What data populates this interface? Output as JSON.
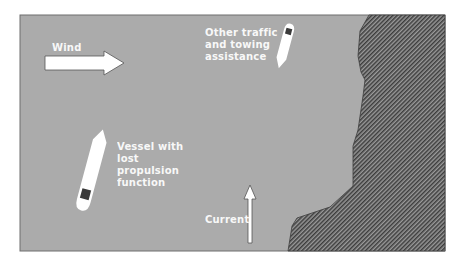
{
  "diagram": {
    "type": "maritime-scenario",
    "colors": {
      "background": "#ffffff",
      "sea": "#ababab",
      "frame_border": "#6e6e6e",
      "land_hatch_dark": "#3c3c3c",
      "land_hatch_light": "#9a9a9a",
      "vessel": "#ffffff",
      "vessel_mark": "#3a3a3a",
      "arrow_fill": "#ffffff",
      "arrow_stroke": "#555555",
      "label_text": "#ffffff"
    },
    "labels": {
      "wind": "Wind",
      "other_traffic": [
        "Other traffic",
        "and towing",
        "assistance"
      ],
      "vessel_lost": [
        "Vessel with",
        "lost",
        "propulsion",
        "function"
      ],
      "current": "Current"
    },
    "elements": [
      {
        "id": "wind-arrow",
        "kind": "arrow",
        "direction": "right",
        "label": "Wind"
      },
      {
        "id": "current-arrow",
        "kind": "arrow",
        "direction": "up",
        "label": "Current"
      },
      {
        "id": "vessel-lost-propulsion",
        "kind": "vessel",
        "label": "Vessel with lost propulsion function"
      },
      {
        "id": "other-traffic-vessel",
        "kind": "vessel",
        "label": "Other traffic and towing assistance"
      },
      {
        "id": "coastline",
        "kind": "land",
        "pattern": "diagonal-hatch",
        "position": "right"
      }
    ]
  }
}
